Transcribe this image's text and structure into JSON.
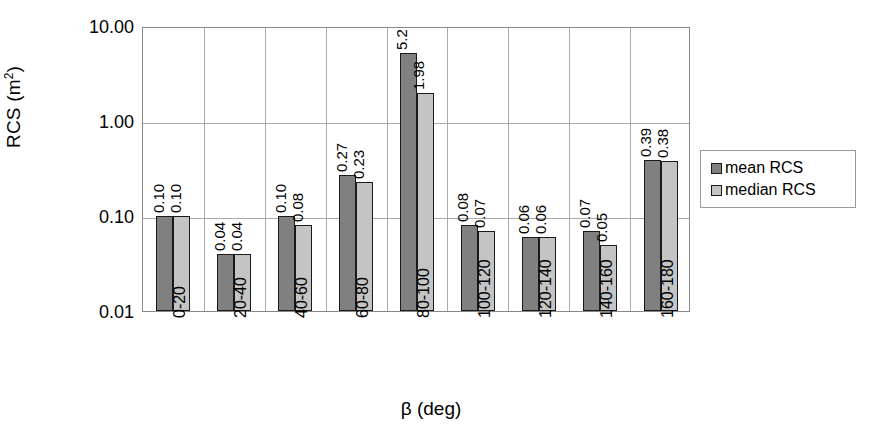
{
  "chart_data": {
    "type": "bar",
    "title": "",
    "xlabel": "β (deg)",
    "ylabel": "RCS (m²)",
    "ylabel_base": "RCS (m",
    "ylabel_sup": "2",
    "ylabel_tail": ")",
    "yscale": "log",
    "ylim": [
      0.01,
      10
    ],
    "grid": true,
    "legend_position": "right",
    "categories": [
      "0-20",
      "20-40",
      "40-60",
      "60-80",
      "80-100",
      "100-120",
      "120-140",
      "140-160",
      "160-180"
    ],
    "y_ticks": [
      "10.00",
      "1.00",
      "0.10",
      "0.01"
    ],
    "y_tick_values": [
      10,
      1,
      0.1,
      0.01
    ],
    "series": [
      {
        "name": "mean RCS",
        "color": "#808080",
        "values": [
          0.1,
          0.04,
          0.1,
          0.27,
          5.2,
          0.08,
          0.06,
          0.07,
          0.39
        ],
        "labels": [
          "0.10",
          "0.04",
          "0.10",
          "0.27",
          "5.2",
          "0.08",
          "0.06",
          "0.07",
          "0.39"
        ]
      },
      {
        "name": "median RCS",
        "color": "#c4c4c4",
        "values": [
          0.1,
          0.04,
          0.08,
          0.23,
          1.98,
          0.07,
          0.06,
          0.05,
          0.38
        ],
        "labels": [
          "0.10",
          "0.04",
          "0.08",
          "0.23",
          "1.98",
          "0.07",
          "0.06",
          "0.05",
          "0.38"
        ]
      }
    ]
  },
  "legend": {
    "items": [
      {
        "label": "mean RCS",
        "swatch": "mean"
      },
      {
        "label": "median RCS",
        "swatch": "median"
      }
    ]
  }
}
